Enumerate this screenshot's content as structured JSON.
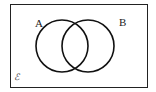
{
  "diagram": {
    "type": "venn",
    "universal_set_label": "ℰ",
    "sets": [
      {
        "label": "A",
        "cx": 62,
        "cy": 46,
        "r": 26
      },
      {
        "label": "B",
        "cx": 88,
        "cy": 46,
        "r": 26
      }
    ],
    "frame": {
      "x": 10,
      "y": 4,
      "width": 137,
      "height": 83
    },
    "stroke_color": "#111111"
  }
}
